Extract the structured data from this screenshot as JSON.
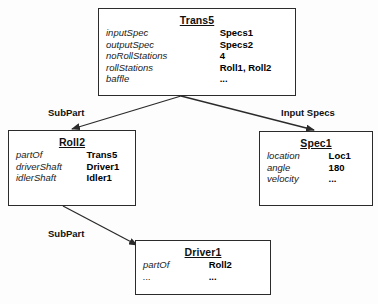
{
  "diagram": {
    "background_color": "#fdfdfd",
    "line_color": "#2b2b2b"
  },
  "nodes": [
    {
      "id": "trans5",
      "title": "Trans5",
      "attributes": [
        {
          "name": "inputSpec",
          "value": "Specs1"
        },
        {
          "name": "outputSpec",
          "value": "Specs2"
        },
        {
          "name": "noRollStations",
          "value": "4"
        },
        {
          "name": "rollStations",
          "value": "Roll1, Roll2"
        },
        {
          "name": "baffle",
          "value": "..."
        }
      ]
    },
    {
      "id": "roll2",
      "title": "Roll2",
      "attributes": [
        {
          "name": "partOf",
          "value": "Trans5"
        },
        {
          "name": "driverShaft",
          "value": "Driver1"
        },
        {
          "name": "idlerShaft",
          "value": "Idler1"
        }
      ]
    },
    {
      "id": "spec1",
      "title": "Spec1",
      "attributes": [
        {
          "name": "location",
          "value": "Loc1"
        },
        {
          "name": "angle",
          "value": "180"
        },
        {
          "name": "velocity",
          "value": "..."
        }
      ]
    },
    {
      "id": "driver1",
      "title": "Driver1",
      "attributes": [
        {
          "name": "partOf",
          "value": "Roll2"
        },
        {
          "name": "...",
          "value": "..."
        }
      ]
    }
  ],
  "edges": [
    {
      "id": "edge-subpart-1",
      "label": "SubPart",
      "from": "trans5",
      "to": "roll2"
    },
    {
      "id": "edge-input-specs",
      "label": "Input Specs",
      "from": "trans5",
      "to": "spec1"
    },
    {
      "id": "edge-subpart-2",
      "label": "SubPart",
      "from": "roll2",
      "to": "driver1"
    }
  ]
}
